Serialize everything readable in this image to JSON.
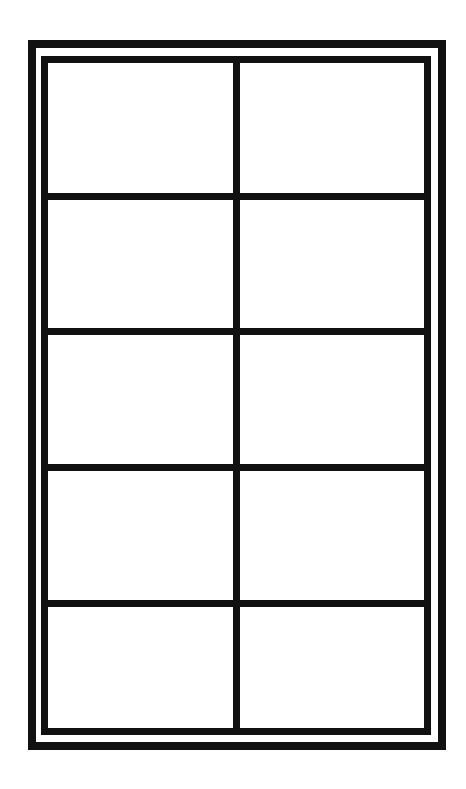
{
  "diagram": {
    "type": "window-pane-grid",
    "columns": 2,
    "rows": 5,
    "colors": {
      "line": "#111111",
      "background": "#ffffff"
    },
    "frame": {
      "outer": {
        "x": 28,
        "y": 40,
        "width": 418,
        "height": 710,
        "stroke": 8
      },
      "inner": {
        "x": 41,
        "y": 56,
        "width": 390,
        "height": 679,
        "stroke": 7
      }
    },
    "vertical_divider_x": 233,
    "horizontal_divider_y": [
      193,
      328,
      464,
      600
    ],
    "panes": [
      {
        "row": 1,
        "col": 1
      },
      {
        "row": 1,
        "col": 2
      },
      {
        "row": 2,
        "col": 1
      },
      {
        "row": 2,
        "col": 2
      },
      {
        "row": 3,
        "col": 1
      },
      {
        "row": 3,
        "col": 2
      },
      {
        "row": 4,
        "col": 1
      },
      {
        "row": 4,
        "col": 2
      },
      {
        "row": 5,
        "col": 1
      },
      {
        "row": 5,
        "col": 2
      }
    ]
  }
}
